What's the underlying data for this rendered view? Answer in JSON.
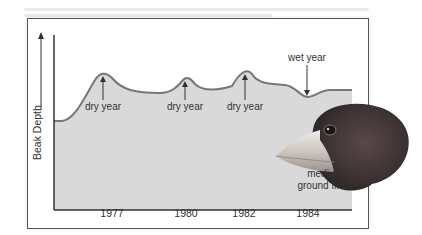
{
  "diagram": {
    "y_axis_label": "Beak Depth",
    "x_ticks": [
      {
        "label": "1977",
        "x": 112
      },
      {
        "label": "1980",
        "x": 186
      },
      {
        "label": "1982",
        "x": 244
      },
      {
        "label": "1984",
        "x": 308
      }
    ],
    "annotations": [
      {
        "label": "dry year",
        "x": 103,
        "y": 86,
        "arrow": "up"
      },
      {
        "label": "dry year",
        "x": 185,
        "y": 86,
        "arrow": "up"
      },
      {
        "label": "dry year",
        "x": 245,
        "y": 86,
        "arrow": "up"
      },
      {
        "label": "wet year",
        "x": 307,
        "y": 34,
        "arrow": "down"
      }
    ],
    "finch_label_line1": "medium",
    "finch_label_line2": "ground finch",
    "colors": {
      "fill": "#d9d9d9",
      "curve": "#777777",
      "axis": "#333333",
      "frame": "#555555"
    }
  }
}
